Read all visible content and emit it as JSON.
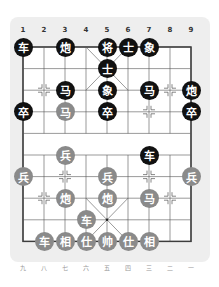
{
  "board": {
    "col_labels_top": [
      "1",
      "2",
      "3",
      "4",
      "5",
      "6",
      "7",
      "8",
      "9"
    ],
    "col_labels_bottom": [
      "九",
      "八",
      "七",
      "六",
      "五",
      "四",
      "三",
      "二",
      "一"
    ],
    "colors": {
      "black_piece": "#111111",
      "red_piece": "#8a8a8a",
      "panel": "#eeeeee",
      "lines": "#555555"
    },
    "origin": {
      "x": 23,
      "y": 47
    },
    "spacing": {
      "x": 21,
      "y": 21.6
    },
    "markers": [
      [
        1,
        2
      ],
      [
        7,
        2
      ],
      [
        6,
        3
      ],
      [
        2,
        6
      ],
      [
        6,
        6
      ],
      [
        1,
        7
      ],
      [
        7,
        7
      ]
    ],
    "pieces": [
      {
        "side": "black",
        "glyph": "车",
        "col": 0,
        "row": 0
      },
      {
        "side": "black",
        "glyph": "炮",
        "col": 2,
        "row": 0
      },
      {
        "side": "black",
        "glyph": "将",
        "col": 4,
        "row": 0
      },
      {
        "side": "black",
        "glyph": "士",
        "col": 5,
        "row": 0
      },
      {
        "side": "black",
        "glyph": "象",
        "col": 6,
        "row": 0
      },
      {
        "side": "black",
        "glyph": "士",
        "col": 4,
        "row": 1
      },
      {
        "side": "black",
        "glyph": "马",
        "col": 2,
        "row": 2
      },
      {
        "side": "black",
        "glyph": "象",
        "col": 4,
        "row": 2
      },
      {
        "side": "black",
        "glyph": "马",
        "col": 6,
        "row": 2
      },
      {
        "side": "black",
        "glyph": "炮",
        "col": 8,
        "row": 2
      },
      {
        "side": "black",
        "glyph": "卒",
        "col": 0,
        "row": 3
      },
      {
        "side": "red",
        "glyph": "马",
        "col": 2,
        "row": 3
      },
      {
        "side": "black",
        "glyph": "卒",
        "col": 4,
        "row": 3
      },
      {
        "side": "black",
        "glyph": "卒",
        "col": 8,
        "row": 3
      },
      {
        "side": "red",
        "glyph": "兵",
        "col": 2,
        "row": 5
      },
      {
        "side": "black",
        "glyph": "车",
        "col": 6,
        "row": 5
      },
      {
        "side": "red",
        "glyph": "兵",
        "col": 0,
        "row": 6
      },
      {
        "side": "red",
        "glyph": "兵",
        "col": 4,
        "row": 6
      },
      {
        "side": "red",
        "glyph": "兵",
        "col": 8,
        "row": 6
      },
      {
        "side": "red",
        "glyph": "炮",
        "col": 2,
        "row": 7
      },
      {
        "side": "red",
        "glyph": "炮",
        "col": 4,
        "row": 7
      },
      {
        "side": "red",
        "glyph": "马",
        "col": 6,
        "row": 7
      },
      {
        "side": "red",
        "glyph": "车",
        "col": 3,
        "row": 8
      },
      {
        "side": "red",
        "glyph": "车",
        "col": 1,
        "row": 9
      },
      {
        "side": "red",
        "glyph": "相",
        "col": 2,
        "row": 9
      },
      {
        "side": "red",
        "glyph": "仕",
        "col": 3,
        "row": 9
      },
      {
        "side": "red",
        "glyph": "帅",
        "col": 4,
        "row": 9
      },
      {
        "side": "red",
        "glyph": "仕",
        "col": 5,
        "row": 9
      },
      {
        "side": "red",
        "glyph": "相",
        "col": 6,
        "row": 9
      }
    ]
  }
}
